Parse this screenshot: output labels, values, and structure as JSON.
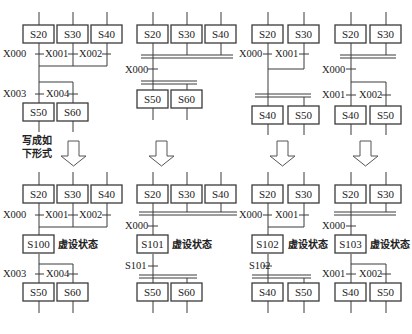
{
  "note_text": [
    "写成如",
    "下形式"
  ],
  "virtual_state_label": "虚设状态",
  "diagrams": [
    {
      "id": "top-1",
      "boxes": [
        {
          "label": "S20",
          "x": 23,
          "y": 25
        },
        {
          "label": "S30",
          "x": 57,
          "y": 25
        },
        {
          "label": "S40",
          "x": 91,
          "y": 25
        },
        {
          "label": "S50",
          "x": 23,
          "y": 103
        },
        {
          "label": "S60",
          "x": 57,
          "y": 103
        }
      ],
      "conditions": [
        {
          "label": "X000",
          "x": 3,
          "y": 57
        },
        {
          "label": "X001",
          "x": 45,
          "y": 57
        },
        {
          "label": "X002",
          "x": 79,
          "y": 57
        },
        {
          "label": "X003",
          "x": 3,
          "y": 97
        },
        {
          "label": "X004",
          "x": 46,
          "y": 97
        }
      ]
    },
    {
      "id": "top-2",
      "boxes": [
        {
          "label": "S20",
          "x": 137,
          "y": 25
        },
        {
          "label": "S30",
          "x": 171,
          "y": 25
        },
        {
          "label": "S40",
          "x": 205,
          "y": 25
        },
        {
          "label": "S50",
          "x": 137,
          "y": 90
        },
        {
          "label": "S60",
          "x": 171,
          "y": 90
        }
      ],
      "conditions": [
        {
          "label": "X000",
          "x": 125,
          "y": 73
        }
      ]
    },
    {
      "id": "top-3",
      "boxes": [
        {
          "label": "S20",
          "x": 252,
          "y": 25
        },
        {
          "label": "S30",
          "x": 288,
          "y": 25
        },
        {
          "label": "S40",
          "x": 252,
          "y": 106
        },
        {
          "label": "S50",
          "x": 288,
          "y": 106
        }
      ],
      "conditions": [
        {
          "label": "X000",
          "x": 239,
          "y": 57
        },
        {
          "label": "X001",
          "x": 275,
          "y": 57
        }
      ]
    },
    {
      "id": "top-4",
      "boxes": [
        {
          "label": "S20",
          "x": 335,
          "y": 25
        },
        {
          "label": "S30",
          "x": 370,
          "y": 25
        },
        {
          "label": "S40",
          "x": 335,
          "y": 106
        },
        {
          "label": "S50",
          "x": 370,
          "y": 106
        }
      ],
      "conditions": [
        {
          "label": "X000",
          "x": 322,
          "y": 73
        },
        {
          "label": "X001",
          "x": 322,
          "y": 98
        },
        {
          "label": "X002",
          "x": 359,
          "y": 98
        }
      ]
    },
    {
      "id": "bottom-1",
      "boxes": [
        {
          "label": "S20",
          "x": 23,
          "y": 185
        },
        {
          "label": "S30",
          "x": 57,
          "y": 185
        },
        {
          "label": "S40",
          "x": 91,
          "y": 185
        },
        {
          "label": "S100",
          "x": 23,
          "y": 235
        },
        {
          "label": "S50",
          "x": 23,
          "y": 283
        },
        {
          "label": "S60",
          "x": 57,
          "y": 283
        }
      ],
      "conditions": [
        {
          "label": "X000",
          "x": 3,
          "y": 218
        },
        {
          "label": "X001",
          "x": 45,
          "y": 218
        },
        {
          "label": "X002",
          "x": 79,
          "y": 218
        },
        {
          "label": "X003",
          "x": 3,
          "y": 277
        },
        {
          "label": "X004",
          "x": 46,
          "y": 277
        }
      ]
    },
    {
      "id": "bottom-2",
      "boxes": [
        {
          "label": "S20",
          "x": 137,
          "y": 185
        },
        {
          "label": "S30",
          "x": 171,
          "y": 185
        },
        {
          "label": "S40",
          "x": 205,
          "y": 185
        },
        {
          "label": "S101",
          "x": 137,
          "y": 235
        },
        {
          "label": "S50",
          "x": 137,
          "y": 283
        },
        {
          "label": "S60",
          "x": 171,
          "y": 283
        }
      ],
      "conditions": [
        {
          "label": "X000",
          "x": 125,
          "y": 229
        },
        {
          "label": "S101",
          "x": 125,
          "y": 269
        }
      ]
    },
    {
      "id": "bottom-3",
      "boxes": [
        {
          "label": "S20",
          "x": 252,
          "y": 185
        },
        {
          "label": "S30",
          "x": 288,
          "y": 185
        },
        {
          "label": "S102",
          "x": 252,
          "y": 235
        },
        {
          "label": "S40",
          "x": 252,
          "y": 283
        },
        {
          "label": "S50",
          "x": 288,
          "y": 283
        }
      ],
      "conditions": [
        {
          "label": "X000",
          "x": 239,
          "y": 218
        },
        {
          "label": "X001",
          "x": 275,
          "y": 218
        },
        {
          "label": "S102",
          "x": 249,
          "y": 269
        }
      ]
    },
    {
      "id": "bottom-4",
      "boxes": [
        {
          "label": "S20",
          "x": 335,
          "y": 185
        },
        {
          "label": "S30",
          "x": 370,
          "y": 185
        },
        {
          "label": "S103",
          "x": 335,
          "y": 235
        },
        {
          "label": "S40",
          "x": 335,
          "y": 283
        },
        {
          "label": "S50",
          "x": 370,
          "y": 283
        }
      ],
      "conditions": [
        {
          "label": "X000",
          "x": 322,
          "y": 229
        },
        {
          "label": "X001",
          "x": 322,
          "y": 277
        },
        {
          "label": "X002",
          "x": 359,
          "y": 277
        }
      ]
    }
  ]
}
